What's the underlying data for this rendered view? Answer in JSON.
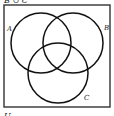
{
  "diagram": {
    "type": "venn",
    "top_caption": "B ∪ C",
    "universe_label": "U",
    "sets": [
      {
        "label": "A",
        "cx": 41,
        "cy": 43,
        "r": 30,
        "label_x": 7,
        "label_y": 31
      },
      {
        "label": "B",
        "cx": 73,
        "cy": 43,
        "r": 30,
        "label_x": 104,
        "label_y": 30
      },
      {
        "label": "C",
        "cx": 58,
        "cy": 73,
        "r": 30,
        "label_x": 84,
        "label_y": 100
      }
    ],
    "universe_rect": {
      "x": 4,
      "y": 5,
      "width": 106,
      "height": 102
    },
    "stroke_color": "#111111",
    "frame_color": "#333333"
  }
}
